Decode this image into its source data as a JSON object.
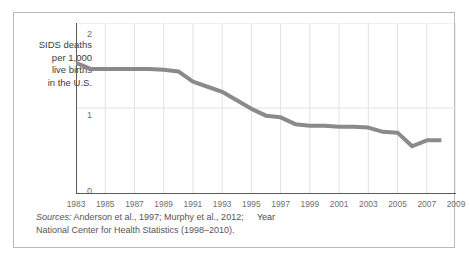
{
  "figure": {
    "border_color": "#b9b9b9",
    "background": "#ffffff"
  },
  "axis": {
    "y_label_lines": [
      "SIDS deaths",
      "per 1,000",
      "live births",
      "in the U.S."
    ],
    "y_ticks": [
      "2",
      "1",
      "0"
    ],
    "x_title": "Year"
  },
  "sources": {
    "label": "Sources:",
    "line1": " Anderson et al., 1997; Murphy et al., 2012;",
    "line2": "National Center for Health Statistics (1998–2010)."
  },
  "chart_data": {
    "type": "line",
    "title": "",
    "xlabel": "Year",
    "ylabel": "SIDS deaths per 1,000 live births in the U.S.",
    "xlim": [
      1983,
      2009
    ],
    "ylim": [
      0,
      2
    ],
    "grid": true,
    "legend": "none",
    "line_color": "#8a8a8a",
    "line_width": 4,
    "tick_labels_x": [
      "1983",
      "1985",
      "1987",
      "1989",
      "1991",
      "1993",
      "1995",
      "1997",
      "1999",
      "2001",
      "2003",
      "2005",
      "2007",
      "2009"
    ],
    "tick_labels_y": [
      "0",
      "1",
      "2"
    ],
    "x": [
      1983,
      1984,
      1985,
      1986,
      1987,
      1988,
      1989,
      1990,
      1991,
      1992,
      1993,
      1994,
      1995,
      1996,
      1997,
      1998,
      1999,
      2000,
      2001,
      2002,
      2003,
      2004,
      2005,
      2006,
      2007,
      2008
    ],
    "values": [
      1.53,
      1.46,
      1.46,
      1.46,
      1.46,
      1.46,
      1.45,
      1.43,
      1.31,
      1.25,
      1.19,
      1.09,
      0.99,
      0.91,
      0.89,
      0.81,
      0.79,
      0.79,
      0.78,
      0.78,
      0.77,
      0.72,
      0.71,
      0.55,
      0.62,
      0.62
    ],
    "series": [
      {
        "name": "SIDS death rate",
        "values": [
          1.53,
          1.46,
          1.46,
          1.46,
          1.46,
          1.46,
          1.45,
          1.43,
          1.31,
          1.25,
          1.19,
          1.09,
          0.99,
          0.91,
          0.89,
          0.81,
          0.79,
          0.79,
          0.78,
          0.78,
          0.77,
          0.72,
          0.71,
          0.55,
          0.62,
          0.62
        ]
      }
    ]
  }
}
